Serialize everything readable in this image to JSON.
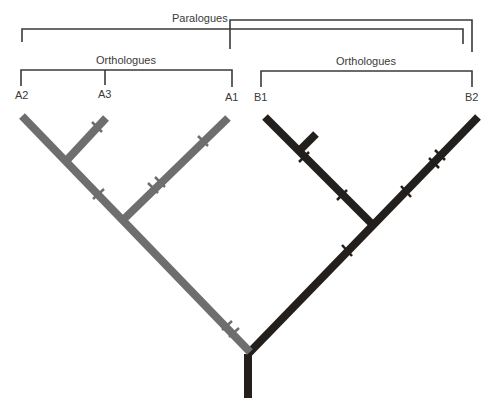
{
  "labels": {
    "paralogues": "Paralogues",
    "orthologues_a": "Orthologues",
    "orthologues_b": "Orthologues"
  },
  "leaves": [
    "A2",
    "A3",
    "A1",
    "B1",
    "B2"
  ],
  "colors": {
    "lineage_a": "#6e6e6e",
    "lineage_b": "#231f1c",
    "bracket": "#3a3a3a"
  }
}
